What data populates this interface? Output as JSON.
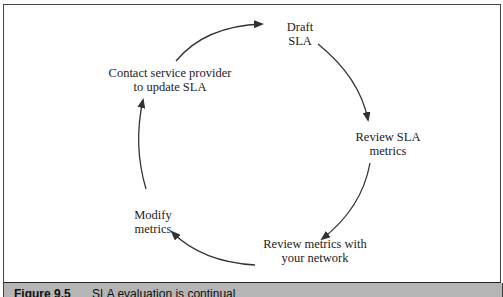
{
  "diagram": {
    "type": "cycle",
    "nodes": [
      {
        "id": "draft",
        "lines": [
          "Draft",
          "SLA"
        ]
      },
      {
        "id": "review-sla",
        "lines": [
          "Review SLA",
          "metrics"
        ]
      },
      {
        "id": "review-network",
        "lines": [
          "Review metrics with",
          "your network"
        ]
      },
      {
        "id": "modify",
        "lines": [
          "Modify",
          "metrics"
        ]
      },
      {
        "id": "contact",
        "lines": [
          "Contact service provider",
          "to update SLA"
        ]
      }
    ],
    "edges": [
      {
        "from": "contact",
        "to": "draft"
      },
      {
        "from": "draft",
        "to": "review-sla"
      },
      {
        "from": "review-sla",
        "to": "review-network"
      },
      {
        "from": "review-network",
        "to": "modify"
      },
      {
        "from": "modify",
        "to": "contact"
      }
    ],
    "colors": {
      "arrow": "#333333",
      "frame": "#444444",
      "caption_bg": "#b5b5b5"
    }
  },
  "caption": {
    "figure_number": "Figure 9.5",
    "text": "SLA evaluation is continual"
  }
}
